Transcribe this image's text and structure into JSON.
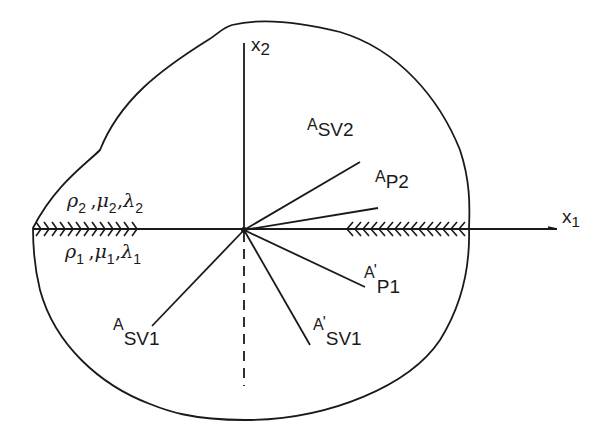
{
  "figure": {
    "axes": {
      "x1": {
        "letter": "x",
        "index": "1"
      },
      "x2": {
        "letter": "x",
        "index": "2"
      }
    },
    "media": {
      "upper": {
        "rho": {
          "sym": "ρ",
          "index": "2"
        },
        "mu": {
          "sym": "μ",
          "index": "2"
        },
        "lambda": {
          "sym": "λ",
          "index": "2"
        },
        "separator": ","
      },
      "lower": {
        "rho": {
          "sym": "ρ",
          "index": "1"
        },
        "mu": {
          "sym": "μ",
          "index": "1"
        },
        "lambda": {
          "sym": "λ",
          "index": "1"
        },
        "separator": ","
      }
    },
    "wave_labels": {
      "A_SV2": {
        "base": "A",
        "sub": "SV2",
        "prime": ""
      },
      "A_P2": {
        "base": "A",
        "sub": "P2",
        "prime": ""
      },
      "A_P1_prime": {
        "base": "A",
        "sub": "P1",
        "prime": "'"
      },
      "A_SV1_prime": {
        "base": "A",
        "sub": "SV1",
        "prime": "'"
      },
      "A_SV1": {
        "base": "A",
        "sub": "SV1",
        "prime": ""
      }
    },
    "colors": {
      "ink": "#1a1a1a",
      "background": "#ffffff"
    }
  }
}
